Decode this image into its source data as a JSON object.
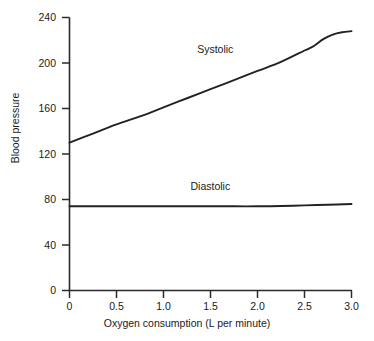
{
  "chart_data": {
    "type": "line",
    "title": "",
    "xlabel": "Oxygen consumption (L per minute)",
    "ylabel": "Blood pressure",
    "xlim": [
      0,
      3.0
    ],
    "ylim": [
      0,
      240
    ],
    "xticks": [
      "0",
      "0.5",
      "1.0",
      "1.5",
      "2.0",
      "2.5",
      "3.0"
    ],
    "xtick_values": [
      0,
      0.5,
      1.0,
      1.5,
      2.0,
      2.5,
      3.0
    ],
    "yticks": [
      "0",
      "40",
      "80",
      "120",
      "160",
      "200",
      "240"
    ],
    "ytick_values": [
      0,
      40,
      80,
      120,
      160,
      200,
      240
    ],
    "grid": false,
    "legend_position": "inline-annotation",
    "annotations": [
      {
        "text": "Systolic",
        "x": 1.55,
        "y": 212
      },
      {
        "text": "Diastolic",
        "x": 1.5,
        "y": 92
      }
    ],
    "series": [
      {
        "name": "Systolic",
        "color": "#222222",
        "x": [
          0.0,
          0.25,
          0.5,
          0.75,
          1.0,
          1.25,
          1.5,
          1.75,
          2.0,
          2.25,
          2.5,
          2.6,
          2.7,
          2.8,
          2.9,
          3.0
        ],
        "values": [
          130,
          138,
          146,
          153,
          161,
          169,
          177,
          185,
          193,
          201,
          211,
          215,
          221,
          225,
          227,
          228
        ]
      },
      {
        "name": "Diastolic",
        "color": "#222222",
        "x": [
          0.0,
          0.25,
          0.5,
          0.75,
          1.0,
          1.25,
          1.5,
          1.75,
          2.0,
          2.25,
          2.5,
          2.75,
          3.0
        ],
        "values": [
          74,
          74,
          74,
          74,
          74,
          74,
          74,
          74,
          74,
          74.3,
          74.8,
          75.4,
          76
        ]
      }
    ]
  },
  "axes": {
    "line_color": "#2b2b2b"
  }
}
